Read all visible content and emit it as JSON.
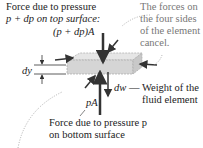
{
  "diagram": {
    "top_label_line1": "Force due to pressure",
    "top_label_line2": "p + dp on top surface:",
    "top_force": "(p + dp)A",
    "side_note_line1": "The forces on",
    "side_note_line2": "the four sides",
    "side_note_line3": "of the element",
    "side_note_line4": "cancel.",
    "dy_label": "dy",
    "dw_label": "dw",
    "weight_line1": "— Weight of the",
    "weight_line2": "fluid element",
    "bottom_force": "pA",
    "bottom_label_line1": "Force due to pressure p",
    "bottom_label_line2": "on bottom surface",
    "colors": {
      "arrow": "#333333",
      "slab": "#d9d9d9",
      "note": "#777777"
    }
  }
}
